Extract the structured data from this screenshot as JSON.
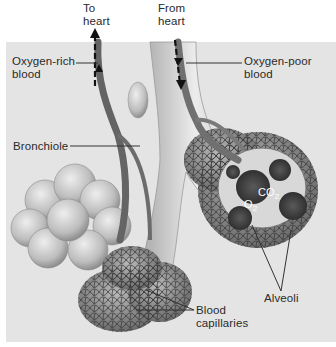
{
  "diagram": {
    "labels": {
      "to_heart": [
        "To",
        "heart"
      ],
      "from_heart": [
        "From",
        "heart"
      ],
      "oxygen_rich": [
        "Oxygen-rich",
        "blood"
      ],
      "oxygen_poor": [
        "Oxygen-poor",
        "blood"
      ],
      "bronchiole": "Bronchiole",
      "blood_capillaries": [
        "Blood",
        "capillaries"
      ],
      "alveoli": "Alveoli",
      "co2": {
        "base": "CO",
        "sub": "2"
      },
      "o2": {
        "base": "O",
        "sub": "2"
      }
    },
    "colors": {
      "panel_bg": "#e4e4e4",
      "page_bg": "#ffffff",
      "vessel": "#6e6e6e",
      "bronchiole_tube": "#d2d2d2",
      "alveolus_sac": "#c2c2c2",
      "capillary_net": "#4a4a4a",
      "label_text": "#2a2a2a",
      "leader_line": "#333333"
    }
  }
}
